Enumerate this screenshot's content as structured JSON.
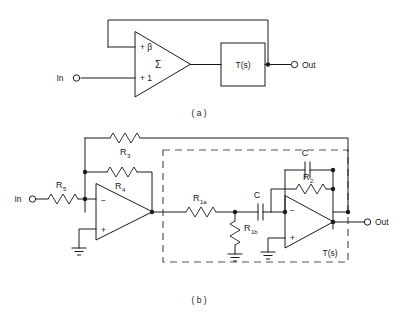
{
  "figure": {
    "panels": [
      {
        "id": "a",
        "caption": "( a )",
        "description": "Block diagram: summing amplifier with gain block T(s) and beta feedback",
        "input_label": "In",
        "output_label": "Out",
        "summer_symbol": "Σ",
        "summer_input_top": "+ β",
        "summer_input_bottom": "+ 1",
        "block_label": "T(s)"
      },
      {
        "id": "b",
        "caption": "( b )",
        "description": "Op-amp realization with resistors R1a R1b R2 R3 R4 R5 and two capacitors C",
        "input_label": "In",
        "output_label": "Out",
        "dashed_block_label": "T(s)",
        "components": [
          {
            "name": "R5",
            "base": "R",
            "sub": "5",
            "kind": "resistor",
            "orientation": "horizontal"
          },
          {
            "name": "R4",
            "base": "R",
            "sub": "4",
            "kind": "resistor",
            "orientation": "horizontal"
          },
          {
            "name": "R3",
            "base": "R",
            "sub": "3",
            "kind": "resistor",
            "orientation": "horizontal"
          },
          {
            "name": "R1a",
            "base": "R",
            "sub": "1a",
            "kind": "resistor",
            "orientation": "horizontal"
          },
          {
            "name": "R1b",
            "base": "R",
            "sub": "1b",
            "kind": "resistor",
            "orientation": "vertical"
          },
          {
            "name": "R2",
            "base": "R",
            "sub": "2",
            "kind": "resistor",
            "orientation": "horizontal"
          },
          {
            "name": "C_series",
            "base": "C",
            "sub": "",
            "kind": "capacitor",
            "orientation": "horizontal"
          },
          {
            "name": "C_feedback",
            "base": "C",
            "sub": "",
            "kind": "capacitor",
            "orientation": "horizontal"
          }
        ],
        "opamps": [
          {
            "name": "opamp-1",
            "inverting_pin": "−",
            "noninverting_pin": "+"
          },
          {
            "name": "opamp-2",
            "inverting_pin": "−",
            "noninverting_pin": "+"
          }
        ]
      }
    ]
  },
  "colors": {
    "ink": "#1a1a1a",
    "dashed": "#555555",
    "paper": "#ffffff"
  }
}
